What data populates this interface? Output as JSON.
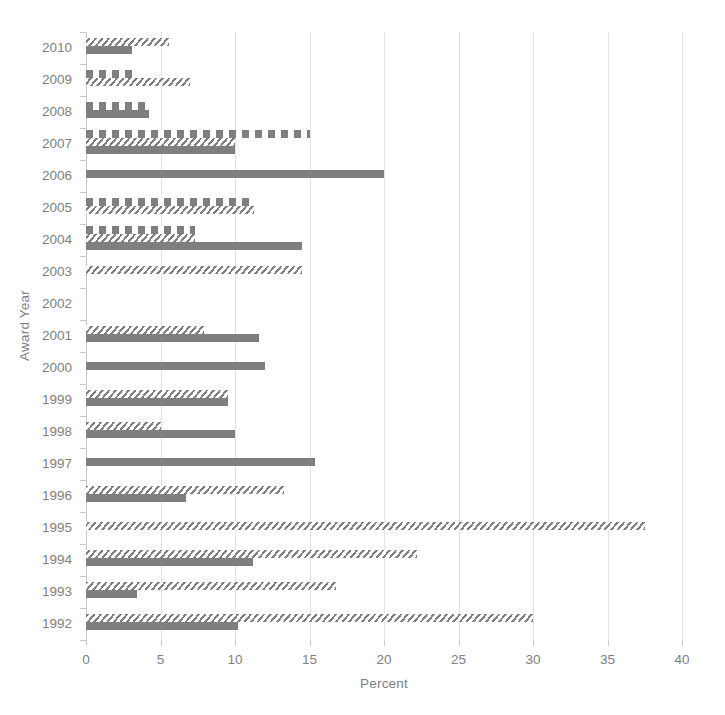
{
  "chart_data": {
    "type": "bar",
    "orientation": "horizontal",
    "title": "",
    "xlabel": "Percent",
    "ylabel": "Award Year",
    "xlim": [
      0,
      40
    ],
    "xticks": [
      0,
      5,
      10,
      15,
      20,
      25,
      30,
      35,
      40
    ],
    "grid": true,
    "legend": "none",
    "categories": [
      "2010",
      "2009",
      "2008",
      "2007",
      "2006",
      "2005",
      "2004",
      "2003",
      "2002",
      "2001",
      "2000",
      "1999",
      "1998",
      "1997",
      "1996",
      "1995",
      "1994",
      "1993",
      "1992"
    ],
    "series": [
      {
        "name": "Series 1",
        "pattern": "dashed",
        "color": "#7f7f7f",
        "values": [
          null,
          3.5,
          4.2,
          15.0,
          null,
          11.3,
          7.3,
          null,
          null,
          null,
          null,
          null,
          null,
          null,
          null,
          null,
          null,
          null,
          null
        ]
      },
      {
        "name": "Series 2",
        "pattern": "diagonal-hatch",
        "color": "#7f7f7f",
        "values": [
          5.6,
          7.0,
          null,
          10.0,
          null,
          11.3,
          7.3,
          14.5,
          null,
          7.9,
          null,
          9.5,
          5.0,
          null,
          13.3,
          37.5,
          22.2,
          16.8,
          30.0
        ]
      },
      {
        "name": "Series 3",
        "pattern": "solid",
        "color": "#7f7f7f",
        "values": [
          3.1,
          null,
          4.2,
          10.0,
          20.0,
          null,
          14.5,
          null,
          null,
          11.6,
          12.0,
          9.5,
          10.0,
          15.4,
          6.7,
          null,
          11.2,
          3.4,
          10.2
        ]
      }
    ]
  },
  "axes": {
    "x_title": "Percent",
    "y_title": "Award Year",
    "x_tick_labels": [
      "0",
      "5",
      "10",
      "15",
      "20",
      "25",
      "30",
      "35",
      "40"
    ],
    "y_tick_labels": [
      "2010",
      "2009",
      "2008",
      "2007",
      "2006",
      "2005",
      "2004",
      "2003",
      "2002",
      "2001",
      "2000",
      "1999",
      "1998",
      "1997",
      "1996",
      "1995",
      "1994",
      "1993",
      "1992"
    ]
  },
  "style": {
    "bar_color": "#7f7f7f",
    "grid_color": "#e2e2e2",
    "axis_color": "#c9c9c9",
    "text_color": "#808080",
    "background": "#ffffff"
  },
  "caption": {
    "cut_off_text": ""
  }
}
